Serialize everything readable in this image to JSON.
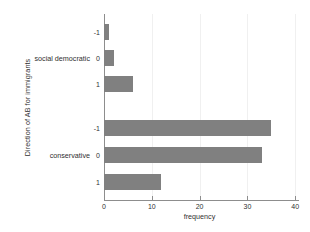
{
  "chart_data": {
    "type": "bar",
    "orientation": "horizontal",
    "title": "",
    "xlabel": "frequency",
    "ylabel": "Direction of AB for immigrants",
    "xlim": [
      0,
      42
    ],
    "xticks": [
      0,
      10,
      20,
      30,
      40
    ],
    "xtick_labels": [
      "0",
      "10",
      "20",
      "30",
      "40"
    ],
    "grid": true,
    "grid_axis": "x",
    "legend": "none",
    "bar_color": "#808080",
    "groups": [
      {
        "name": "social democratic",
        "label": "social democratic",
        "categories": [
          "-1",
          "0",
          "1"
        ],
        "values": [
          1,
          2,
          6
        ]
      },
      {
        "name": "conservative",
        "label": "conservative",
        "categories": [
          "-1",
          "0",
          "1"
        ],
        "values": [
          35,
          33,
          12
        ]
      }
    ],
    "bars": [
      {
        "group": "social democratic",
        "category": "-1",
        "value": 1
      },
      {
        "group": "social democratic",
        "category": "0",
        "value": 2
      },
      {
        "group": "social democratic",
        "category": "1",
        "value": 6
      },
      {
        "group": "conservative",
        "category": "-1",
        "value": 35
      },
      {
        "group": "conservative",
        "category": "0",
        "value": 33
      },
      {
        "group": "conservative",
        "category": "1",
        "value": 12
      }
    ]
  },
  "axes": {
    "y_title": "Direction of AB for immigrants",
    "x_title": "frequency"
  }
}
